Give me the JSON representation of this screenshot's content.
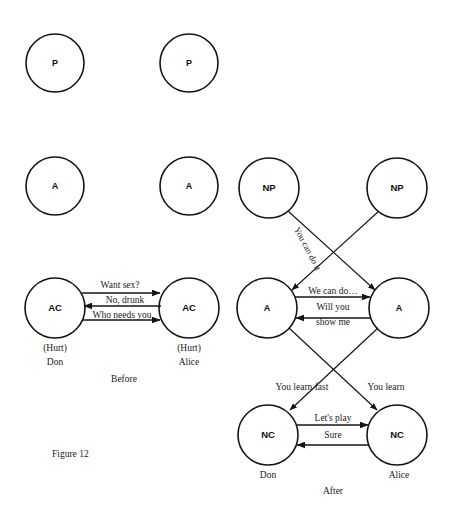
{
  "figure": {
    "caption": "Figure 12",
    "before_label": "Before",
    "after_label": "After"
  },
  "before_diagram": {
    "left_person": {
      "name": "Don",
      "feeling": "(Hurt)",
      "ego_states": [
        {
          "id": "p",
          "label": "P"
        },
        {
          "id": "a",
          "label": "A"
        },
        {
          "id": "ac",
          "label": "AC"
        }
      ]
    },
    "right_person": {
      "name": "Alice",
      "feeling": "(Hurt)",
      "ego_states": [
        {
          "id": "p",
          "label": "P"
        },
        {
          "id": "a",
          "label": "A"
        },
        {
          "id": "ac",
          "label": "AC"
        }
      ]
    },
    "transactions": [
      {
        "text": "Want sex?",
        "direction": "left-to-right"
      },
      {
        "text": "No, drunk",
        "direction": "right-to-left"
      },
      {
        "text": "Who needs you",
        "direction": "left-to-right"
      }
    ]
  },
  "after_diagram": {
    "left_person": {
      "name": "Don",
      "ego_states": [
        {
          "id": "np",
          "label": "NP"
        },
        {
          "id": "a",
          "label": "A"
        },
        {
          "id": "nc",
          "label": "NC"
        }
      ]
    },
    "right_person": {
      "name": "Alice",
      "ego_states": [
        {
          "id": "np",
          "label": "NP"
        },
        {
          "id": "a",
          "label": "A"
        },
        {
          "id": "nc",
          "label": "NC"
        }
      ]
    },
    "transactions": [
      {
        "text": "You can do it",
        "direction": "np-left-to-a-right",
        "rotated": true
      },
      {
        "text": "We can do…",
        "direction": "left-to-right"
      },
      {
        "text": "Will you",
        "direction": "right-to-left"
      },
      {
        "text": "show me",
        "direction": "right-to-left"
      },
      {
        "text": "You learn fast",
        "direction": "a-right-to-nc-left"
      },
      {
        "text": "You learn",
        "direction": "a-left-to-nc-right"
      },
      {
        "text": "Let's play",
        "direction": "left-to-right"
      },
      {
        "text": "Sure",
        "direction": "right-to-left"
      }
    ]
  },
  "colors": {
    "ink": "#141414",
    "paper": "#ffffff"
  }
}
